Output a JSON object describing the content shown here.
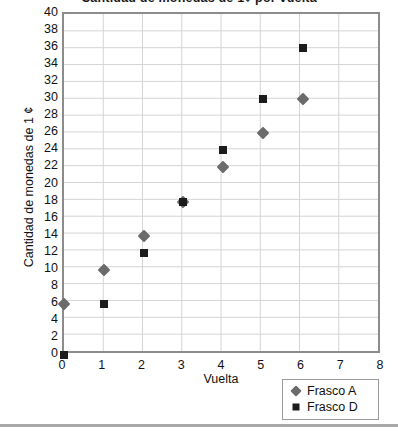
{
  "chart_data": {
    "type": "scatter",
    "title": "Cantidad de monedas de 1¢ por vuelta",
    "xlabel": "Vuelta",
    "ylabel": "Cantidad de monedas de 1 ¢",
    "xlim": [
      0,
      8
    ],
    "ylim": [
      0,
      40
    ],
    "x_ticks": [
      0,
      1,
      2,
      3,
      4,
      5,
      6,
      7,
      8
    ],
    "y_ticks": [
      0,
      2,
      4,
      6,
      8,
      10,
      12,
      14,
      16,
      18,
      20,
      22,
      24,
      26,
      28,
      30,
      32,
      34,
      36,
      38,
      40
    ],
    "grid": true,
    "legend_position": "bottom-right",
    "series": [
      {
        "name": "Frasco A",
        "marker": "diamond",
        "color": "#6b6b6b",
        "x": [
          0,
          1,
          2,
          3,
          4,
          5,
          6
        ],
        "values": [
          6,
          10,
          14,
          18,
          22,
          26,
          30
        ]
      },
      {
        "name": "Frasco D",
        "marker": "square",
        "color": "#1c1c1c",
        "x": [
          0,
          1,
          2,
          3,
          4,
          5,
          6
        ],
        "values": [
          0,
          6,
          12,
          18,
          24,
          30,
          36
        ]
      }
    ]
  },
  "axes": {
    "frame_color": "#8c8c8c",
    "grid_color": "#d4d4d4"
  },
  "legend": {
    "items": [
      {
        "label": "Frasco A",
        "marker": "diamond",
        "color": "#6b6b6b"
      },
      {
        "label": "Frasco D",
        "marker": "square",
        "color": "#1c1c1c"
      }
    ]
  }
}
